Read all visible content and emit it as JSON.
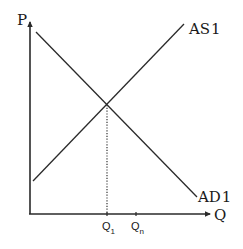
{
  "diagram": {
    "type": "AD-AS supply and demand diagram",
    "axes": {
      "y_label": "P",
      "x_label": "Q"
    },
    "curves": [
      {
        "id": "as1",
        "label": "AS",
        "label_index": "1",
        "slope": "upward"
      },
      {
        "id": "ad1",
        "label": "AD",
        "label_index": "1",
        "slope": "downward"
      }
    ],
    "x_ticks": [
      {
        "id": "q1",
        "label": "Q",
        "subscript": "1"
      },
      {
        "id": "qn",
        "label": "Q",
        "subscript": "n"
      }
    ],
    "equilibrium": {
      "description": "intersection of AS1 and AD1, dotted line dropped to Q1"
    },
    "colors": {
      "line": "#2a2a2a",
      "background": "#ffffff"
    }
  }
}
